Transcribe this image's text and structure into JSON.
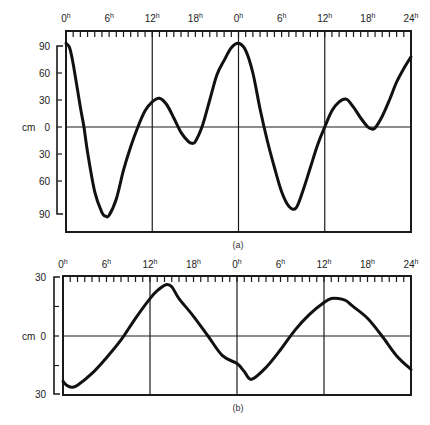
{
  "chart_data": [
    {
      "id": "a",
      "type": "line",
      "caption": "(a)",
      "ylabel": "cm",
      "xlabel": "",
      "x_tick_labels": [
        "0",
        "6",
        "12",
        "18",
        "0",
        "6",
        "12",
        "18",
        "24"
      ],
      "x_tick_superscript": "h",
      "x_range_hours": [
        0,
        48
      ],
      "y_tick_labels": [
        "90",
        "60",
        "30",
        "0",
        "30",
        "60",
        "90"
      ],
      "y_tick_values": [
        90,
        60,
        30,
        0,
        -30,
        -60,
        -90
      ],
      "ylim": [
        -105,
        105
      ],
      "grid": {
        "vertical_hours": [
          12,
          24,
          36
        ],
        "horizontal_values": [
          0
        ]
      },
      "x": [
        0,
        0.5,
        1,
        2,
        2.5,
        3,
        4,
        5,
        5.5,
        6,
        7,
        8,
        9,
        10,
        11,
        12,
        13,
        14,
        15,
        16,
        17,
        17.5,
        18,
        19,
        20,
        21,
        22,
        23,
        24,
        25,
        26,
        27,
        28,
        29,
        30,
        31,
        32,
        33,
        34,
        35,
        36,
        37,
        38,
        39,
        40,
        41,
        42,
        42.5,
        43,
        44,
        45,
        46,
        47,
        48
      ],
      "values": [
        93,
        88,
        70,
        22,
        0,
        -28,
        -72,
        -95,
        -99,
        -98,
        -80,
        -48,
        -22,
        0,
        18,
        28,
        32,
        25,
        10,
        -6,
        -16,
        -18,
        -16,
        2,
        30,
        58,
        74,
        88,
        93,
        85,
        60,
        20,
        -15,
        -45,
        -72,
        -88,
        -90,
        -70,
        -45,
        -20,
        0,
        18,
        28,
        31,
        22,
        10,
        0,
        -2,
        -1,
        12,
        30,
        50,
        65,
        78
      ]
    },
    {
      "id": "b",
      "type": "line",
      "caption": "(b)",
      "ylabel": "cm",
      "xlabel": "",
      "x_tick_labels": [
        "0",
        "6",
        "12",
        "18",
        "0",
        "6",
        "12",
        "18",
        "24"
      ],
      "x_tick_superscript": "h",
      "x_range_hours": [
        0,
        48
      ],
      "y_tick_labels": [
        "30",
        "0",
        "30"
      ],
      "y_tick_values": [
        30,
        0,
        -30
      ],
      "ylim": [
        -30,
        30
      ],
      "grid": {
        "vertical_hours": [
          12,
          24,
          36
        ],
        "horizontal_values": [
          0
        ]
      },
      "x": [
        0,
        0.5,
        1.2,
        2,
        4,
        6,
        8,
        10,
        12,
        13,
        14.2,
        15,
        16,
        18,
        20,
        22,
        24,
        25,
        26,
        28,
        30,
        32,
        34,
        36,
        37,
        38,
        39,
        40,
        42,
        44,
        46,
        48
      ],
      "values": [
        -23,
        -25,
        -26,
        -25,
        -19,
        -11,
        -2,
        9,
        19,
        23,
        26,
        25,
        19,
        10,
        0,
        -10,
        -14,
        -18,
        -22,
        -16,
        -7,
        3,
        11,
        17,
        19,
        19,
        18,
        15,
        9,
        0,
        -10,
        -17
      ]
    }
  ],
  "panels": {
    "a": {
      "caption": "(a)",
      "unit": "cm"
    },
    "b": {
      "caption": "(b)",
      "unit": "cm"
    }
  }
}
